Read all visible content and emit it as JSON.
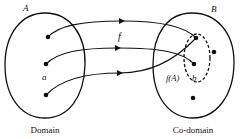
{
  "diagram": {
    "type": "function-mapping",
    "labels": {
      "set_a": "A",
      "set_b": "B",
      "function": "f",
      "element_a": "a",
      "image": "f(A)",
      "element_b": "b",
      "domain": "Domain",
      "codomain": "Co-domain"
    },
    "colors": {
      "stroke": "#111111",
      "background": "#ffffff"
    },
    "domain_points": [
      {
        "x": 48,
        "y": 37
      },
      {
        "x": 46,
        "y": 64
      },
      {
        "x": 46,
        "y": 95
      }
    ],
    "codomain_points": [
      {
        "x": 196,
        "y": 38
      },
      {
        "x": 194,
        "y": 64
      },
      {
        "x": 214,
        "y": 52
      },
      {
        "x": 193,
        "y": 98
      }
    ],
    "mappings": [
      {
        "from": 0,
        "to": 0
      },
      {
        "from": 1,
        "to": 1
      },
      {
        "from": 2,
        "to": 0
      }
    ]
  }
}
